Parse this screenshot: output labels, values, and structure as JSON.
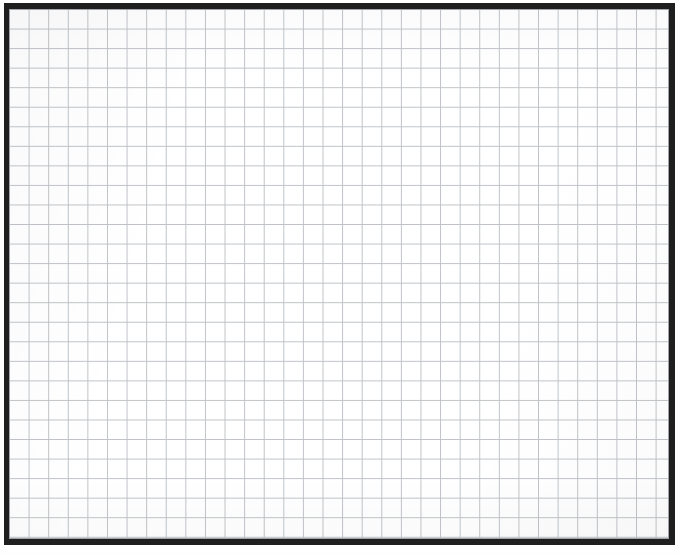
{
  "sheet": {
    "kind": "grid-paper",
    "background_color": "#fefefe",
    "field_color": "#ffffff"
  },
  "frame": {
    "color": "#1e1e1e",
    "top_width_px": 6,
    "right_width_px": 6,
    "bottom_width_px": 6,
    "left_width_px": 5,
    "left_px": 4,
    "top_px": 3,
    "width_px": 671,
    "height_px": 542,
    "inner_hairline_color": "#a0a4a8"
  },
  "grid": {
    "line_color": "#bfc3c7",
    "line_width_px": 1,
    "cell_width_px": 19.6,
    "cell_height_px": 19.55,
    "columns": 34,
    "rows": 27,
    "origin_offset_x_px": 0,
    "origin_offset_y_px": 0
  },
  "chart_data": {
    "type": "table",
    "title": "",
    "subtitle": "",
    "xlabel": "",
    "ylabel": "",
    "grid": true,
    "legend": null,
    "categories": [],
    "values": [],
    "series": [],
    "annotations": [],
    "note": "Blank ruled grid paper — no plotted data, labels, ticks or legend are rendered in the image."
  }
}
